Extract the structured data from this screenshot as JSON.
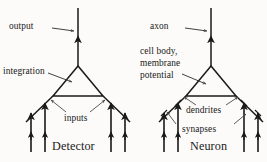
{
  "figure": {
    "kind": "side-by-side-schematic-diagram",
    "background_color": "#fcfbf9",
    "ink_color": "#1a1a1a",
    "panels": [
      {
        "id": "detector",
        "caption": "Detector",
        "labels": {
          "output": "output",
          "integration": "integration",
          "inputs": "inputs"
        }
      },
      {
        "id": "neuron",
        "caption": "Neuron",
        "labels": {
          "axon": "axon",
          "cell_body_line1": "cell body,",
          "cell_body_line2": "membrane",
          "cell_body_line3": "potential",
          "dendrites": "dendrites",
          "synapses": "synapses"
        }
      }
    ]
  },
  "left": {
    "caption": "Detector",
    "output_label": "output",
    "integration_label": "integration",
    "inputs_label": "inputs"
  },
  "right": {
    "caption": "Neuron",
    "axon_label": "axon",
    "cell_body_1": "cell body,",
    "cell_body_2": "membrane",
    "cell_body_3": "potential",
    "dendrites_label": "dendrites",
    "synapses_label": "synapses"
  }
}
